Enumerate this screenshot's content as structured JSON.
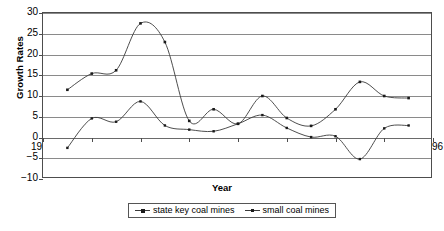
{
  "chart_data": {
    "type": "line",
    "title": "",
    "xlabel": "Year",
    "ylabel": "Growth Rates",
    "xlim": [
      1980,
      1996
    ],
    "ylim": [
      -10,
      30
    ],
    "grid": true,
    "legend_position": "bottom",
    "xticks": [
      1980,
      1982,
      1984,
      1986,
      1988,
      1990,
      1992,
      1994,
      1996
    ],
    "yticks": [
      -10,
      -5,
      0,
      5,
      10,
      15,
      20,
      25,
      30
    ],
    "x": [
      1981,
      1982,
      1983,
      1984,
      1985,
      1986,
      1987,
      1988,
      1989,
      1990,
      1991,
      1992,
      1993,
      1994,
      1995
    ],
    "series": [
      {
        "name": "state key coal mines",
        "values": [
          11.5,
          15.4,
          16.2,
          27.5,
          23.0,
          4.0,
          6.8,
          3.3,
          10.0,
          4.7,
          2.8,
          6.8,
          13.4,
          10.0,
          9.5
        ]
      },
      {
        "name": "small coal mines",
        "values": [
          -2.5,
          4.6,
          3.8,
          8.7,
          2.9,
          1.9,
          1.5,
          3.3,
          5.4,
          2.3,
          0.1,
          0.3,
          -5.2,
          2.2,
          2.9
        ]
      }
    ]
  },
  "axes": {
    "y_title": "Growth Rates",
    "x_title": "Year",
    "y_tick_labels": [
      "30",
      "25",
      "20",
      "15",
      "10",
      "5",
      "0",
      "−5",
      "−10"
    ],
    "x_tick_labels": [
      "1980",
      "1982",
      "1984",
      "1986",
      "1988",
      "1990",
      "1992",
      "1994",
      "1996"
    ]
  },
  "legend": {
    "items": [
      {
        "label": "state key coal mines",
        "marker": "square",
        "color": "#333333"
      },
      {
        "label": "small coal mines",
        "marker": "square-open",
        "color": "#333333"
      }
    ]
  },
  "colors": {
    "series_1": "#3a3a3a",
    "series_2": "#3a3a3a",
    "grid": "#8a8a8a",
    "frame": "#4d4d4d",
    "background": "#ffffff"
  }
}
